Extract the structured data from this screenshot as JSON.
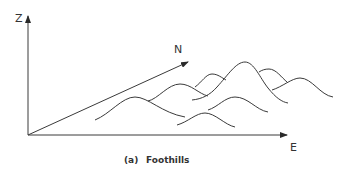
{
  "figure": {
    "axes": {
      "z_label": "Z",
      "n_label": "N",
      "e_label": "E"
    },
    "caption": {
      "tag": "(a)",
      "title": "Foothills"
    },
    "colors": {
      "line": "#3a3a3a",
      "text": "#333333",
      "background": "#ffffff"
    },
    "hills": [
      {
        "name": "left-hill",
        "path": "M95,120 C110,114 122,97 135,97 C148,97 162,113 185,117"
      },
      {
        "name": "back-left-hill",
        "path": "M148,101 C158,99 168,84 180,84 C191,84 199,94 208,96"
      },
      {
        "name": "small-back-hill",
        "path": "M195,87 C202,82 206,74 212,74 C218,74 222,78 226,80"
      },
      {
        "name": "tall-hill",
        "path": "M192,100 C202,99 210,95 217,87 C228,75 236,62 245,62 C254,62 260,78 268,88 C276,98 282,102 288,103"
      },
      {
        "name": "small-right-hill",
        "path": "M259,72 C262,70 265,69 269,69 C276,69 282,78 287,82"
      },
      {
        "name": "right-hill",
        "path": "M272,90 C282,87 292,78 300,78 C312,78 320,95 333,97"
      },
      {
        "name": "middle-lower-hill",
        "path": "M208,110 C218,107 225,97 235,97 C248,97 256,110 268,112"
      },
      {
        "name": "bottom-hill",
        "path": "M177,125 C188,122 196,113 205,113 C215,113 225,125 235,127"
      }
    ]
  }
}
